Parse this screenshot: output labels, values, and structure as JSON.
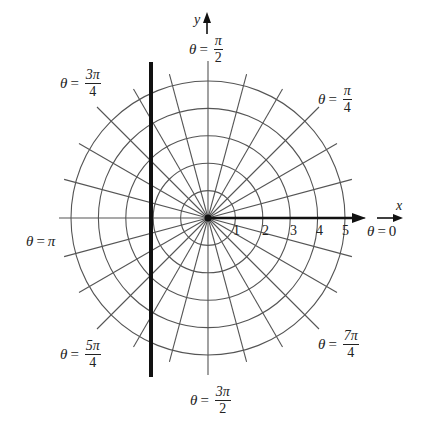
{
  "diagram": {
    "type": "polar-grid",
    "center": {
      "x": 208,
      "y": 218
    },
    "ring_spacing_px": 27.4,
    "ring_count": 5,
    "ray_count": 24,
    "ray_step_deg": 15,
    "line_color": "#555555",
    "axis_color": "#111111",
    "thick_line": {
      "x": 151,
      "y_top": 62,
      "y_bottom": 377
    }
  },
  "axes": {
    "x_label": "x",
    "y_label": "y"
  },
  "ticks": [
    "1",
    "2",
    "3",
    "4",
    "5"
  ],
  "angle_labels": {
    "theta_0": {
      "var": "θ",
      "eq": "=",
      "value": "0"
    },
    "theta_pi_4": {
      "var": "θ",
      "eq": "=",
      "num": "π",
      "den": "4"
    },
    "theta_pi_2": {
      "var": "θ",
      "eq": "=",
      "num": "π",
      "den": "2"
    },
    "theta_3pi_4": {
      "var": "θ",
      "eq": "=",
      "num": "3π",
      "den": "4"
    },
    "theta_pi": {
      "var": "θ",
      "eq": "=",
      "value": "π"
    },
    "theta_5pi_4": {
      "var": "θ",
      "eq": "=",
      "num": "5π",
      "den": "4"
    },
    "theta_3pi_2": {
      "var": "θ",
      "eq": "=",
      "num": "3π",
      "den": "2"
    },
    "theta_7pi_4": {
      "var": "θ",
      "eq": "=",
      "num": "7π",
      "den": "4"
    }
  }
}
